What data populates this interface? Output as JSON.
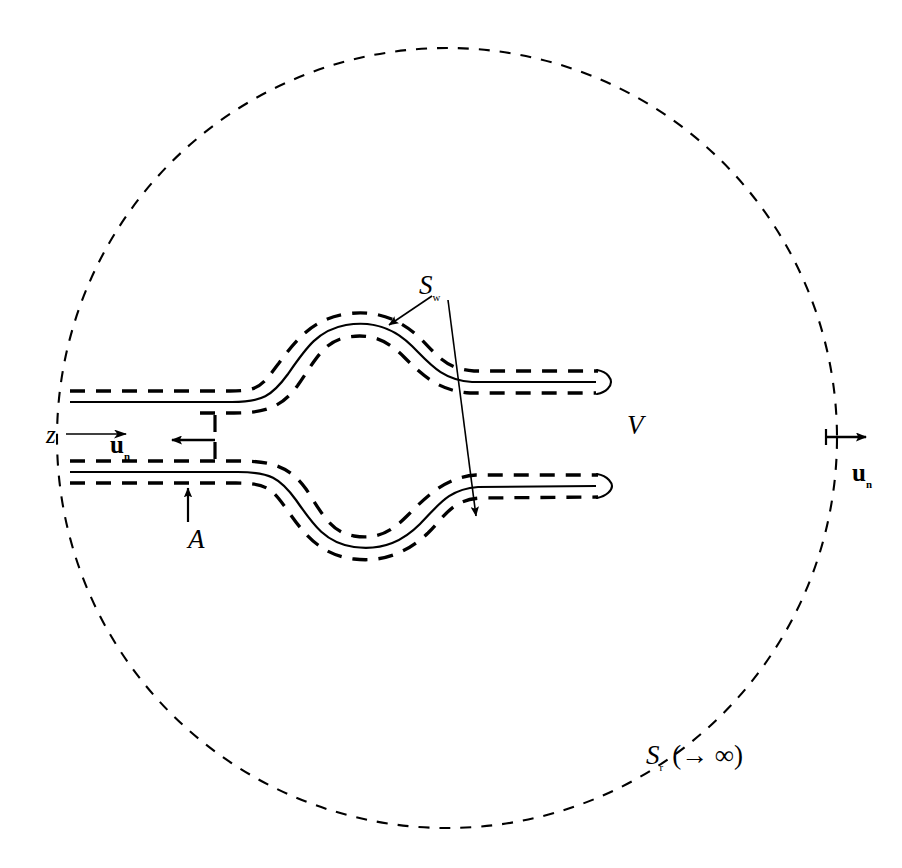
{
  "figure": {
    "background_color": "#ffffff",
    "line_color": "#000000",
    "width": 902,
    "height": 868
  },
  "labels": {
    "wake_surface": {
      "symbol": "S",
      "subscript": "w",
      "text": "Sw",
      "x": 419,
      "y": 272
    },
    "far_field_surface": {
      "symbol": "S",
      "subscript": "r",
      "suffix": "(→ ∞)",
      "text": "Sr (→ ∞)",
      "x": 646,
      "y": 742
    },
    "volume": {
      "symbol": "V",
      "text": "V",
      "x": 627,
      "y": 412
    },
    "axis_z": {
      "symbol": "z",
      "text": "z",
      "x": 46,
      "y": 422
    },
    "cross_section_area": {
      "symbol": "A",
      "text": "A",
      "x": 188,
      "y": 526
    },
    "normal_inner": {
      "symbol": "u",
      "subscript": "n",
      "text": "un",
      "x": 110,
      "y": 432
    },
    "normal_outer": {
      "symbol": "u",
      "subscript": "n",
      "text": "un",
      "x": 852,
      "y": 460
    }
  },
  "icons": {
    "z_axis_arrow": "arrow-right-icon",
    "inner_normal_arrow": "arrow-left-icon",
    "outer_normal_arrow": "arrow-right-icon",
    "area_arrow": "arrow-up-icon",
    "wake_leader_upper": "arrow-pointer-icon",
    "wake_leader_lower": "arrow-pointer-icon"
  },
  "geometry": {
    "outer_boundary": {
      "name": "far-field-circle",
      "shape": "circle",
      "center_x": 447,
      "center_y": 438,
      "radius": 390,
      "stroke_dash": "10 9",
      "stroke_width": 2
    },
    "upper_wing": {
      "name": "upper-wing-wake",
      "centerline_solid": true,
      "offset": 11,
      "start_x": 70,
      "end_x": 600,
      "inlet_y": 402,
      "crest_y": 326,
      "tail_y": 382
    },
    "lower_wing": {
      "name": "lower-wing-wake",
      "centerline_solid": true,
      "offset": 11,
      "start_x": 70,
      "end_x": 600,
      "inlet_y": 472,
      "trough_y": 540,
      "tail_y": 482
    },
    "inlet_plane": {
      "name": "inlet-cross-section",
      "x": 215,
      "top_y": 418,
      "bottom_y": 462,
      "dashed": true
    }
  },
  "styles": {
    "stroke_color": "#000000",
    "thick_dash": "14 10",
    "fine_dash": "10 9",
    "solid_width": 2.2,
    "dash_width": 3.4
  }
}
